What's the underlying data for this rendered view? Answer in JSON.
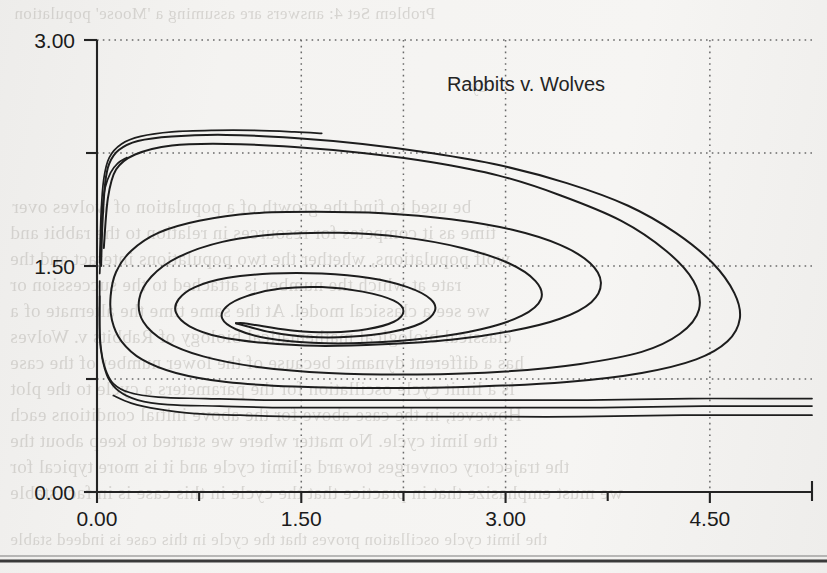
{
  "page": {
    "kind": "scanned-book-page-figure",
    "background_color": "#f2f1ef",
    "bleed_through_lines": [
      "Problem Set 4: answers are assuming a 'Moose' population",
      "dy",
      "be used to find the growth of a population of wolves over",
      "time as it competes for resources in relation to the rabbit and",
      "wolf populations, whether the two populations interact and the",
      "rate at which the number is attached to the succession or",
      "we see a classical model. At the same time the alternate of a",
      "classical biological mathematical biology of Rabbits v. Wolves",
      "has a different dynamic because of the lower number of the case",
      "is a limit cycle oscillation for the parameters a cycle to the plot",
      "However, in the case above for the above initial conditions each",
      "the limit cycle. No matter where we started to keep about the",
      "the trajectory converges toward a limit cycle and it is more typical for",
      "we must emphasize that in practice that the cycle in this case is in fact stable",
      "the limit cycle oscillation proves that the cycle in this case is indeed stable"
    ]
  },
  "chart_data": {
    "type": "line",
    "title": "Rabbits v. Wolves",
    "xlabel": "",
    "ylabel": "",
    "xlim": [
      0.0,
      5.25
    ],
    "ylim": [
      0.0,
      3.0
    ],
    "grid": true,
    "legend": "none",
    "x_ticks_major": [
      "0.00",
      "1.50",
      "3.00",
      "4.50"
    ],
    "x_tick_values_major": [
      0.0,
      1.5,
      3.0,
      4.5
    ],
    "x_tick_values_minor": [
      0.75,
      2.25,
      3.75,
      5.25
    ],
    "y_ticks_major": [
      "0.00",
      "1.50",
      "3.00"
    ],
    "y_tick_values_major": [
      0.0,
      1.5,
      3.0
    ],
    "y_tick_values_minor": [
      0.75,
      2.25
    ],
    "gridline_x_values": [
      1.5,
      2.25,
      3.0,
      4.5
    ],
    "gridline_y_values": [
      0.75,
      1.5,
      2.25,
      3.0
    ],
    "fixed_point": {
      "x": 1.02,
      "y": 1.12,
      "label": "stable focus"
    },
    "series": [
      {
        "name": "trajectory-inward-spiral-outer",
        "note": "large outer loop reaching x about 4.7, spiralling inward to the focus",
        "points": [
          [
            0.03,
            1.5
          ],
          [
            0.04,
            1.78
          ],
          [
            0.06,
            2.05
          ],
          [
            0.09,
            2.18
          ],
          [
            0.16,
            2.27
          ],
          [
            0.3,
            2.33
          ],
          [
            0.55,
            2.36
          ],
          [
            0.95,
            2.37
          ],
          [
            1.45,
            2.35
          ],
          [
            1.95,
            2.31
          ],
          [
            2.45,
            2.25
          ],
          [
            2.95,
            2.17
          ],
          [
            3.45,
            2.05
          ],
          [
            3.9,
            1.9
          ],
          [
            4.25,
            1.72
          ],
          [
            4.52,
            1.52
          ],
          [
            4.68,
            1.32
          ],
          [
            4.72,
            1.15
          ],
          [
            4.63,
            1.0
          ],
          [
            4.4,
            0.88
          ],
          [
            4.0,
            0.79
          ],
          [
            3.45,
            0.73
          ],
          [
            2.8,
            0.7
          ],
          [
            2.1,
            0.69
          ],
          [
            1.45,
            0.7
          ],
          [
            0.95,
            0.73
          ],
          [
            0.58,
            0.79
          ],
          [
            0.33,
            0.88
          ],
          [
            0.18,
            1.0
          ],
          [
            0.11,
            1.14
          ],
          [
            0.1,
            1.3
          ],
          [
            0.14,
            1.46
          ],
          [
            0.25,
            1.6
          ],
          [
            0.45,
            1.72
          ],
          [
            0.75,
            1.8
          ],
          [
            1.15,
            1.85
          ],
          [
            1.6,
            1.86
          ],
          [
            2.1,
            1.85
          ],
          [
            2.6,
            1.81
          ],
          [
            3.05,
            1.74
          ],
          [
            3.4,
            1.64
          ],
          [
            3.62,
            1.52
          ],
          [
            3.7,
            1.39
          ],
          [
            3.63,
            1.26
          ],
          [
            3.4,
            1.15
          ],
          [
            3.05,
            1.07
          ],
          [
            2.6,
            1.01
          ],
          [
            2.1,
            0.98
          ],
          [
            1.62,
            0.97
          ],
          [
            1.22,
            0.99
          ],
          [
            0.9,
            1.03
          ],
          [
            0.68,
            1.1
          ],
          [
            0.58,
            1.19
          ],
          [
            0.6,
            1.28
          ],
          [
            0.72,
            1.36
          ],
          [
            0.95,
            1.42
          ],
          [
            1.28,
            1.45
          ],
          [
            1.65,
            1.45
          ],
          [
            2.0,
            1.42
          ],
          [
            2.28,
            1.36
          ],
          [
            2.45,
            1.28
          ],
          [
            2.48,
            1.2
          ],
          [
            2.38,
            1.12
          ],
          [
            2.15,
            1.06
          ],
          [
            1.85,
            1.03
          ],
          [
            1.55,
            1.03
          ],
          [
            1.28,
            1.06
          ],
          [
            1.1,
            1.1
          ],
          [
            1.02,
            1.12
          ]
        ]
      },
      {
        "name": "trajectory-inward-spiral-mid",
        "note": "second loop, peak near y 2.30, right extent x about 4.45",
        "points": [
          [
            0.05,
            1.62
          ],
          [
            0.08,
            1.95
          ],
          [
            0.14,
            2.14
          ],
          [
            0.28,
            2.24
          ],
          [
            0.55,
            2.3
          ],
          [
            0.95,
            2.31
          ],
          [
            1.45,
            2.29
          ],
          [
            1.95,
            2.25
          ],
          [
            2.45,
            2.19
          ],
          [
            2.95,
            2.1
          ],
          [
            3.4,
            1.97
          ],
          [
            3.85,
            1.8
          ],
          [
            4.18,
            1.6
          ],
          [
            4.38,
            1.4
          ],
          [
            4.42,
            1.21
          ],
          [
            4.28,
            1.05
          ],
          [
            4.0,
            0.93
          ],
          [
            3.55,
            0.85
          ],
          [
            3.0,
            0.8
          ],
          [
            2.35,
            0.78
          ],
          [
            1.7,
            0.79
          ],
          [
            1.18,
            0.83
          ],
          [
            0.78,
            0.9
          ],
          [
            0.5,
            1.0
          ],
          [
            0.34,
            1.13
          ],
          [
            0.31,
            1.28
          ],
          [
            0.4,
            1.43
          ],
          [
            0.6,
            1.56
          ],
          [
            0.92,
            1.66
          ],
          [
            1.32,
            1.71
          ],
          [
            1.78,
            1.72
          ],
          [
            2.25,
            1.69
          ],
          [
            2.68,
            1.62
          ],
          [
            3.02,
            1.52
          ],
          [
            3.22,
            1.4
          ],
          [
            3.26,
            1.28
          ],
          [
            3.12,
            1.17
          ],
          [
            2.82,
            1.08
          ],
          [
            2.42,
            1.02
          ],
          [
            1.98,
            0.99
          ],
          [
            1.58,
            0.99
          ],
          [
            1.25,
            1.02
          ],
          [
            1.02,
            1.08
          ],
          [
            0.92,
            1.15
          ],
          [
            0.95,
            1.23
          ],
          [
            1.1,
            1.3
          ],
          [
            1.35,
            1.35
          ],
          [
            1.65,
            1.36
          ],
          [
            1.95,
            1.33
          ],
          [
            2.18,
            1.27
          ],
          [
            2.25,
            1.2
          ],
          [
            2.18,
            1.13
          ],
          [
            1.98,
            1.08
          ],
          [
            1.72,
            1.06
          ],
          [
            1.45,
            1.07
          ],
          [
            1.22,
            1.1
          ],
          [
            1.08,
            1.12
          ],
          [
            1.02,
            1.12
          ]
        ]
      },
      {
        "name": "trajectory-upper-arc-short",
        "note": "short steep arc from near the y-axis flattening to a plateau near y 2.37, terminating at x about 1.65",
        "points": [
          [
            0.02,
            1.52
          ],
          [
            0.03,
            1.85
          ],
          [
            0.05,
            2.08
          ],
          [
            0.09,
            2.22
          ],
          [
            0.18,
            2.31
          ],
          [
            0.32,
            2.36
          ],
          [
            0.55,
            2.39
          ],
          [
            0.85,
            2.4
          ],
          [
            1.15,
            2.4
          ],
          [
            1.45,
            2.39
          ],
          [
            1.65,
            2.38
          ]
        ]
      },
      {
        "name": "trajectory-steep-ascender",
        "note": "near-vertical curve rising from the y-axis and ending at about (0.22, 2.22)",
        "points": [
          [
            0.02,
            1.45
          ],
          [
            0.03,
            1.68
          ],
          [
            0.04,
            1.88
          ],
          [
            0.06,
            2.02
          ],
          [
            0.1,
            2.12
          ],
          [
            0.15,
            2.18
          ],
          [
            0.22,
            2.22
          ]
        ]
      },
      {
        "name": "trajectory-lower-flat-a",
        "note": "descends down the y-axis then runs flat at about y 0.63",
        "points": [
          [
            0.02,
            1.4
          ],
          [
            0.02,
            1.1
          ],
          [
            0.03,
            0.95
          ],
          [
            0.06,
            0.82
          ],
          [
            0.12,
            0.72
          ],
          [
            0.24,
            0.66
          ],
          [
            0.45,
            0.63
          ],
          [
            0.8,
            0.62
          ],
          [
            1.3,
            0.61
          ],
          [
            2.0,
            0.61
          ],
          [
            2.8,
            0.61
          ],
          [
            3.6,
            0.61
          ],
          [
            4.35,
            0.62
          ],
          [
            5.0,
            0.62
          ],
          [
            5.25,
            0.62
          ]
        ]
      },
      {
        "name": "trajectory-lower-flat-b",
        "note": "second flat trajectory slightly below, about y 0.57",
        "points": [
          [
            0.02,
            1.3
          ],
          [
            0.02,
            1.02
          ],
          [
            0.04,
            0.88
          ],
          [
            0.08,
            0.76
          ],
          [
            0.16,
            0.67
          ],
          [
            0.3,
            0.61
          ],
          [
            0.52,
            0.58
          ],
          [
            0.9,
            0.57
          ],
          [
            1.4,
            0.56
          ],
          [
            2.1,
            0.56
          ],
          [
            2.9,
            0.56
          ],
          [
            3.7,
            0.56
          ],
          [
            4.45,
            0.57
          ],
          [
            5.05,
            0.57
          ],
          [
            5.25,
            0.57
          ]
        ]
      },
      {
        "name": "trajectory-lower-flat-c",
        "note": "lowest trajectory starting at about x 0.12 and flattening near y 0.50",
        "points": [
          [
            0.12,
            0.64
          ],
          [
            0.25,
            0.59
          ],
          [
            0.45,
            0.55
          ],
          [
            0.72,
            0.52
          ],
          [
            1.05,
            0.51
          ],
          [
            1.5,
            0.5
          ],
          [
            2.1,
            0.5
          ],
          [
            2.8,
            0.5
          ],
          [
            3.55,
            0.5
          ],
          [
            4.3,
            0.51
          ],
          [
            5.0,
            0.51
          ],
          [
            5.25,
            0.51
          ]
        ]
      }
    ]
  }
}
